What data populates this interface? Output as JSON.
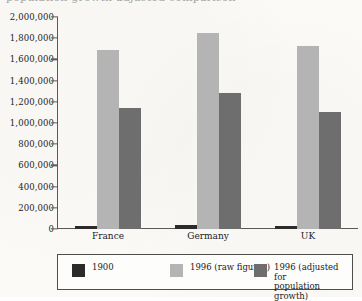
{
  "chart_data": {
    "type": "bar",
    "title": "",
    "xlabel": "",
    "ylabel": "",
    "categories": [
      "France",
      "Germany",
      "UK"
    ],
    "series": [
      {
        "name": "1900",
        "color": "#2b2b2b",
        "values": [
          30000,
          40000,
          30000
        ]
      },
      {
        "name": "1996 (raw figures)",
        "color": "#b4b4b4",
        "values": [
          1690000,
          1850000,
          1730000
        ]
      },
      {
        "name": "1996 (adjusted for\npopulation growth)",
        "color": "#6e6e6e",
        "values": [
          1140000,
          1280000,
          1100000
        ]
      }
    ],
    "ylim": [
      0,
      2000000
    ],
    "ytick_values": [
      0,
      200000,
      400000,
      600000,
      800000,
      1000000,
      1200000,
      1400000,
      1600000,
      1800000,
      2000000
    ],
    "ytick_labels": [
      "0",
      "200,000",
      "400,000",
      "600,000",
      "800,000",
      "1,000,000",
      "1,200,000",
      "1,400,000",
      "1,600,000",
      "1,800,000",
      "2,000,000"
    ],
    "grid": false,
    "legend_position": "bottom"
  },
  "legend": {
    "items": [
      {
        "label": "1900",
        "color": "#2b2b2b"
      },
      {
        "label": "1996 (raw figures)",
        "color": "#b4b4b4"
      },
      {
        "label": "1996 (adjusted for\npopulation growth)",
        "color": "#6e6e6e"
      }
    ]
  },
  "top_clip": {
    "text": "population growth adjusted comparison"
  }
}
